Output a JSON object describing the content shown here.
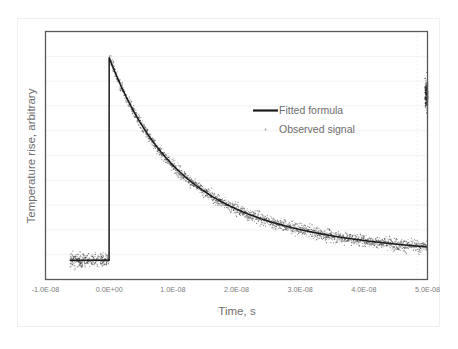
{
  "chart_data": {
    "type": "line",
    "title": "",
    "xlabel": "Time, s",
    "ylabel": "Temperature rise, arbitrary",
    "xlim": [
      -1e-08,
      5e-08
    ],
    "ylim": [
      0,
      1.1
    ],
    "grid": true,
    "x_tick_labels": [
      "-1.0E-08",
      "0.0E+00",
      "1.0E-08",
      "2.0E-08",
      "3.0E-08",
      "4.0E-08",
      "5.0E-08"
    ],
    "x_tick_values": [
      -1e-08,
      0.0,
      1e-08,
      2e-08,
      3e-08,
      4e-08,
      5e-08
    ],
    "y_tick_labels": [
      "",
      "",
      "",
      "",
      "",
      "",
      "",
      "",
      "",
      "",
      ""
    ],
    "y_gridline_count": 10,
    "legend_position": "upper-center-right",
    "series": [
      {
        "name": "Fitted formula",
        "style": "line",
        "color": "#1a1a1a",
        "comment": "Baseline 0.085 for t<0; instantaneous rise at t=0 to 0.985; double-exponential decay back toward baseline by t=5.0E-08",
        "model": {
          "baseline": 0.085,
          "peak": 0.985,
          "t_rise": 0.0,
          "components": [
            {
              "amplitude": 0.56,
              "tau": 9e-09
            },
            {
              "amplitude": 0.34,
              "tau": 2.8e-08
            }
          ]
        },
        "x": [
          -1e-08,
          -6e-09,
          -3e-09,
          -5e-10,
          0.0,
          1.5e-09,
          4e-09,
          8e-09,
          1.2e-08,
          1.6e-08,
          2e-08,
          2.4e-08,
          2.8e-08,
          3.2e-08,
          3.6e-08,
          4e-08,
          4.4e-08,
          4.8e-08,
          5e-08
        ],
        "y": [
          0.085,
          0.085,
          0.085,
          0.085,
          0.985,
          0.865,
          0.7,
          0.545,
          0.455,
          0.392,
          0.345,
          0.307,
          0.276,
          0.249,
          0.225,
          0.204,
          0.185,
          0.167,
          0.159
        ]
      },
      {
        "name": "Observed signal",
        "style": "scatter",
        "color": "#3a3a3a",
        "comment": "Dense noisy samples scattered about the fitted curve; flat noise burst before t=0 spanning -0.62E-08 to 0, and an isolated high-amplitude noise burst at the right edge near t=5.0E-08",
        "noise_sigma": 0.022,
        "sample_count": 2200,
        "right_edge_burst": {
          "t": 4.98e-08,
          "y_center": 0.82,
          "spread": 0.1
        }
      }
    ]
  },
  "legend": {
    "entries": [
      {
        "label": "Fitted formula",
        "marker": "line"
      },
      {
        "label": "Observed signal",
        "marker": "dot"
      }
    ]
  },
  "colors": {
    "plot_border": "#595959",
    "gridline": "#f2f2f2",
    "tick_text": "#7a7a7a",
    "axis_title": "#6f6f6f",
    "series_line": "#1a1a1a",
    "scatter": "#3a3a3a",
    "figure_background": "#ffffff",
    "outer_border": "#f0f0f0"
  }
}
